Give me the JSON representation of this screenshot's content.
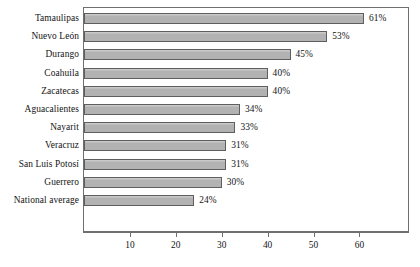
{
  "chart_data": {
    "type": "bar",
    "orientation": "horizontal",
    "title": "",
    "subtitle": "",
    "xlabel": "",
    "ylabel": "",
    "categories": [
      "Tamaulipas",
      "Nuevo León",
      "Durango",
      "Coahuila",
      "Zacatecas",
      "Aguacalientes",
      "Nayarit",
      "Veracruz",
      "San Luis Potosí",
      "Guerrero",
      "National average"
    ],
    "values": [
      61,
      53,
      45,
      40,
      40,
      34,
      33,
      31,
      31,
      30,
      24
    ],
    "data_labels": [
      "61%",
      "53%",
      "45%",
      "40%",
      "40%",
      "34%",
      "33%",
      "31%",
      "31%",
      "30%",
      "24%"
    ],
    "xlim": [
      0,
      70
    ],
    "x_ticks": [
      10,
      20,
      30,
      40,
      50,
      60
    ],
    "x_tick_labels": [
      "10",
      "20",
      "30",
      "40",
      "50",
      "60"
    ],
    "grid": false,
    "legend": null,
    "bar_fill_color": "#b2b2b2",
    "bar_border_color": "#5e5e5e",
    "axis_color": "#6f6f6f",
    "background_color": "#ffffff",
    "text_color": "#141414"
  }
}
